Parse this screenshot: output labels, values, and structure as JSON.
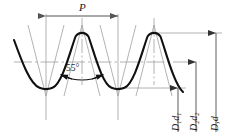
{
  "drawing": {
    "title": "55-degree thread profile",
    "pitch_label": "P",
    "angle_label": "55°",
    "minor_diameter_label": "D",
    "minor_diameter_sub1": "1",
    "minor_diameter_label2": "d",
    "minor_diameter_sub2": "1",
    "pitch_diameter_label": "D",
    "pitch_diameter_sub1": "2",
    "pitch_diameter_label2": "d",
    "pitch_diameter_sub2": "2",
    "major_diameter_label": "D,d",
    "colors": {
      "profile": "#111111",
      "construction": "#9a9a9a",
      "dimension": "#6e6e6e",
      "background": "#ffffff"
    },
    "geometry": {
      "pitch_px": 72,
      "crest_y": 33,
      "root_y": 88,
      "centerline_y": 62,
      "apex_y": 25,
      "vee_bottom_y": 96,
      "trough_x_left": 46,
      "peak_x_left": 82,
      "trough_x_right": 118,
      "peak_x_right": 154
    },
    "dimension_lines": {
      "pitch": {
        "x1": 46,
        "x2": 118,
        "y": 16
      },
      "minor": {
        "x": 178,
        "y_top": 88,
        "y_bottom": 132
      },
      "pitch_dia": {
        "x": 196,
        "y_top": 62,
        "y_bottom": 132
      },
      "major_dia": {
        "x": 216,
        "y_top": 38,
        "y_bottom": 132
      }
    }
  }
}
